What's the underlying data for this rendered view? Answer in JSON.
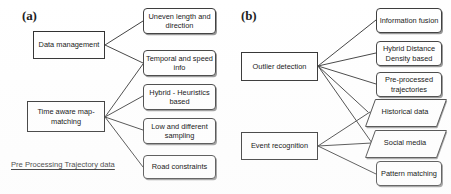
{
  "figure": {
    "panels": [
      {
        "id": "a",
        "label": "(a)",
        "caption": "Pre Processing Trajectory data",
        "sources": [
          {
            "id": "data-management",
            "label": "Data management"
          },
          {
            "id": "time-aware-map-matching",
            "label": "Time aware map-matching"
          }
        ],
        "targets": [
          {
            "id": "uneven-length-and-direction",
            "label": "Uneven length and direction",
            "shape": "rounded"
          },
          {
            "id": "temporal-and-speed-info",
            "label": "Temporal and speed info",
            "shape": "rounded"
          },
          {
            "id": "hybrid-heuristics-based",
            "label": "Hybrid - Heuristics based",
            "shape": "rounded"
          },
          {
            "id": "low-and-different-sampling",
            "label": "Low and different sampling",
            "shape": "rounded"
          },
          {
            "id": "road-constraints",
            "label": "Road constraints",
            "shape": "rounded"
          }
        ],
        "edges": [
          {
            "from": "data-management",
            "to": "uneven-length-and-direction"
          },
          {
            "from": "data-management",
            "to": "temporal-and-speed-info"
          },
          {
            "from": "time-aware-map-matching",
            "to": "temporal-and-speed-info"
          },
          {
            "from": "time-aware-map-matching",
            "to": "hybrid-heuristics-based"
          },
          {
            "from": "time-aware-map-matching",
            "to": "low-and-different-sampling"
          },
          {
            "from": "time-aware-map-matching",
            "to": "road-constraints"
          }
        ]
      },
      {
        "id": "b",
        "label": "(b)",
        "caption": "",
        "sources": [
          {
            "id": "outlier-detection",
            "label": "Outlier detection"
          },
          {
            "id": "event-recognition",
            "label": "Event recognition"
          }
        ],
        "targets": [
          {
            "id": "information-fusion",
            "label": "Information fusion",
            "shape": "rounded"
          },
          {
            "id": "hybrid-distance-density-based",
            "label": "Hybrid Distance Density based",
            "shape": "rounded"
          },
          {
            "id": "pre-processed-trajectories",
            "label": "Pre-processed trajectories",
            "shape": "rounded"
          },
          {
            "id": "historical-data",
            "label": "Historical data",
            "shape": "parallelogram"
          },
          {
            "id": "social-media",
            "label": "Social media",
            "shape": "parallelogram"
          },
          {
            "id": "pattern-matching",
            "label": "Pattern matching",
            "shape": "rounded"
          }
        ],
        "edges": [
          {
            "from": "outlier-detection",
            "to": "information-fusion"
          },
          {
            "from": "outlier-detection",
            "to": "hybrid-distance-density-based"
          },
          {
            "from": "outlier-detection",
            "to": "pre-processed-trajectories"
          },
          {
            "from": "outlier-detection",
            "to": "historical-data"
          },
          {
            "from": "outlier-detection",
            "to": "social-media"
          },
          {
            "from": "event-recognition",
            "to": "historical-data"
          },
          {
            "from": "event-recognition",
            "to": "social-media"
          },
          {
            "from": "event-recognition",
            "to": "pattern-matching"
          }
        ]
      }
    ],
    "colors": {
      "stroke": "#3c3c3c",
      "text": "#1a1a1a",
      "background": "#ffffff"
    }
  }
}
